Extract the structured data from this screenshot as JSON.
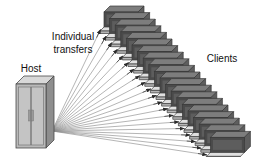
{
  "diagram": {
    "background_color": "#ffffff",
    "labels": {
      "host": "Host",
      "transfers_line1": "Individual",
      "transfers_line2": "transfers",
      "clients": "Clients"
    },
    "colors": {
      "text": "#111111",
      "line": "#8d8d8d",
      "arrow": "#2b2b2b",
      "host_top": "#d8d8d8",
      "host_front": "#b9b9b9",
      "host_side": "#8e8e8e",
      "host_outline": "#4a4a4a",
      "client_screen": "#4a4a4a",
      "client_top": "#7d7d7d",
      "client_side": "#5e5e5e",
      "client_base": "#e0e0e0",
      "client_base_side": "#b5b5b5",
      "client_outline": "#3a3a3a"
    },
    "host": {
      "name": "Host",
      "x": 16,
      "y": 76,
      "width": 30,
      "height": 72,
      "depth": 8,
      "door_count": 2
    },
    "transfer_lines": {
      "count": 20,
      "origin_x": 52,
      "origin_y": 131,
      "has_arrowheads": true
    },
    "clients": {
      "count": 20,
      "label": "Clients",
      "start_x": 104,
      "start_y": 12,
      "step_x": 5.6,
      "step_y": 6.6,
      "box_width": 34,
      "box_height": 15
    },
    "label_positions": {
      "host": {
        "x": 31,
        "y": 72
      },
      "transfers": {
        "x": 73,
        "y": 40
      },
      "clients": {
        "x": 222,
        "y": 62
      }
    }
  }
}
